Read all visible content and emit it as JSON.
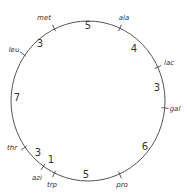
{
  "diagram": {
    "type": "circular genetic map",
    "circle": {
      "cx": 88,
      "cy": 101,
      "rx": 77,
      "ry": 80,
      "stroke": "#555555"
    },
    "markers": [
      {
        "name": "met",
        "tick": [
          54,
          28
        ],
        "angle": -32,
        "label_pos": [
          44,
          20
        ]
      },
      {
        "name": "ala",
        "tick": [
          120,
          28
        ],
        "angle": 32,
        "label_pos": [
          124,
          20
        ]
      },
      {
        "name": "lac",
        "tick": [
          158,
          67
        ],
        "angle": 62,
        "label_pos": [
          169,
          65
        ]
      },
      {
        "name": "gal",
        "tick": [
          165,
          108
        ],
        "angle": 90,
        "label_pos": [
          175,
          111
        ]
      },
      {
        "name": "pro",
        "tick": [
          120,
          175
        ],
        "angle": -25,
        "label_pos": [
          122,
          187
        ]
      },
      {
        "name": "trp",
        "tick": [
          54,
          174
        ],
        "angle": 25,
        "label_pos": [
          52,
          187
        ]
      },
      {
        "name": "azi",
        "tick": [
          43,
          167
        ],
        "angle": 40,
        "label_pos": [
          37,
          180
        ]
      },
      {
        "name": "thr",
        "tick": [
          24,
          148
        ],
        "angle": 55,
        "label_pos": [
          12,
          150
        ]
      },
      {
        "name": "leu",
        "tick": [
          23,
          54
        ],
        "angle": -55,
        "label_pos": [
          14,
          52
        ]
      }
    ],
    "distances": [
      {
        "between": "met-ala",
        "value": "5",
        "pos": [
          88,
          29
        ]
      },
      {
        "between": "ala-lac",
        "value": "4",
        "pos": [
          134,
          52
        ]
      },
      {
        "between": "lac-gal",
        "value": "3",
        "pos": [
          157,
          91
        ]
      },
      {
        "between": "gal-pro",
        "value": "6",
        "pos": [
          145,
          150
        ]
      },
      {
        "between": "pro-trp",
        "value": "5",
        "pos": [
          86,
          178
        ]
      },
      {
        "between": "trp-azi",
        "value": "1",
        "pos": [
          51,
          163
        ]
      },
      {
        "between": "azi-thr",
        "value": "3",
        "pos": [
          38,
          156
        ]
      },
      {
        "between": "thr-leu",
        "value": "7",
        "pos": [
          17,
          101
        ]
      },
      {
        "between": "leu-met",
        "value": "3",
        "pos": [
          40,
          47
        ]
      }
    ]
  }
}
